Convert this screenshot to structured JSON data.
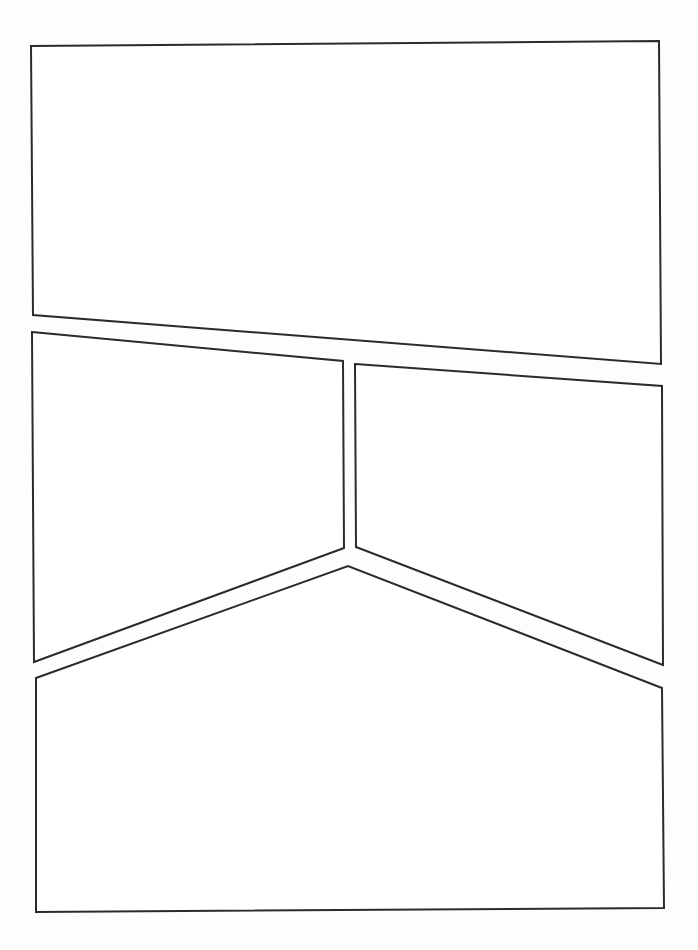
{
  "document": {
    "title": "Comic Page Layout Template",
    "kind": "blank-comic-page",
    "width": 698,
    "height": 950,
    "background_color": "#fdfdfd",
    "page_color": "#ffffff"
  },
  "style": {
    "stroke_color": "#2b2b2d",
    "stroke_width": 2,
    "fill_color": "#ffffff",
    "panel_count_label": "4"
  },
  "panels": [
    {
      "id": "panel-1",
      "name": "top-wide-panel",
      "label": "1",
      "caption": "",
      "shape": "quadrilateral",
      "points": "31,46 659,41 661,364 33,315",
      "row": "top"
    },
    {
      "id": "panel-2",
      "name": "middle-left-panel",
      "label": "2",
      "caption": "",
      "shape": "quadrilateral",
      "points": "32,332 343,361 344,548 34,662",
      "row": "middle"
    },
    {
      "id": "panel-3",
      "name": "middle-right-panel",
      "label": "3",
      "caption": "",
      "shape": "quadrilateral",
      "points": "355,364 662,386 663,665 356,547",
      "row": "middle"
    },
    {
      "id": "panel-4",
      "name": "bottom-chevron-panel",
      "label": "4",
      "caption": "",
      "shape": "pentagon",
      "points": "36,678 348,566 662,688 664,908 36,912",
      "row": "bottom"
    }
  ]
}
